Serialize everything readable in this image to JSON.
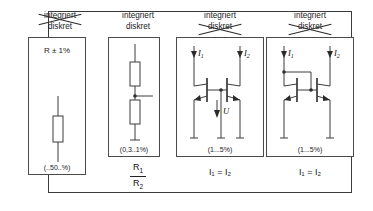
{
  "figure": {
    "title_hidden": "",
    "columns": [
      {
        "id": "col1",
        "head_top": "integriert",
        "head_bottom": "diskret",
        "struck": "top",
        "box_label": "R ± 1%",
        "tolerance": "(..50..%)",
        "under_label": "",
        "symbol": "single-resistor"
      },
      {
        "id": "col2",
        "head_top": "integriert",
        "head_bottom": "diskret",
        "struck": "none",
        "box_label": "",
        "tolerance": "(0,3..1%)",
        "under_numerator": "R",
        "under_numerator_sub": "1",
        "under_denominator": "R",
        "under_denominator_sub": "2",
        "symbol": "resistor-divider"
      },
      {
        "id": "col3",
        "head_top": "integriert",
        "head_bottom": "diskret",
        "struck": "bottom",
        "box_label": "",
        "tolerance": "(1...5%)",
        "under_label": "I₁ = I₂",
        "current_left": "I",
        "current_left_sub": "1",
        "current_right": "I",
        "current_right_sub": "2",
        "voltage_label": "U",
        "symbol": "current-mirror-open-base"
      },
      {
        "id": "col4",
        "head_top": "integriert",
        "head_bottom": "diskret",
        "struck": "bottom",
        "box_label": "",
        "tolerance": "(1...5%)",
        "under_label": "I₁ = I₂",
        "current_left": "I",
        "current_left_sub": "1",
        "current_right": "I",
        "current_right_sub": "2",
        "symbol": "current-mirror-diode-connected"
      }
    ],
    "colors": {
      "frame": "#3a3a3a",
      "box": "#4a4a4a",
      "wire": "#3d3d3d",
      "text": "#111111",
      "background": "#ffffff"
    }
  }
}
